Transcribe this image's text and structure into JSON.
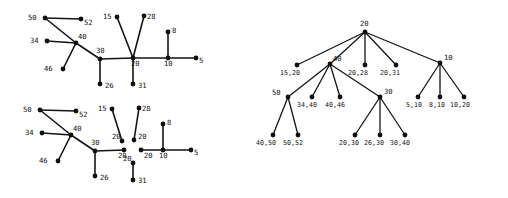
{
  "figure": {
    "panels": [
      {
        "id": "graph-top-left",
        "kind": "graph",
        "nodes": [
          {
            "label": "50",
            "x": 45,
            "y": 18,
            "lx": 28,
            "ly": 20
          },
          {
            "label": "52",
            "x": 81,
            "y": 19,
            "lx": 84,
            "ly": 25
          },
          {
            "label": "34",
            "x": 47,
            "y": 41,
            "lx": 30,
            "ly": 43
          },
          {
            "label": "40",
            "x": 76,
            "y": 43,
            "lx": 78,
            "ly": 39
          },
          {
            "label": "46",
            "x": 63,
            "y": 69,
            "lx": 44,
            "ly": 71
          },
          {
            "label": "30",
            "x": 100,
            "y": 59,
            "lx": 96,
            "ly": 53
          },
          {
            "label": "26",
            "x": 100,
            "y": 84,
            "lx": 105,
            "ly": 88
          },
          {
            "label": "15",
            "x": 117,
            "y": 17,
            "lx": 103,
            "ly": 19
          },
          {
            "label": "28",
            "x": 144,
            "y": 16,
            "lx": 147,
            "ly": 19
          },
          {
            "label": "20",
            "x": 133,
            "y": 58,
            "lx": 131,
            "ly": 66
          },
          {
            "label": "31",
            "x": 133,
            "y": 84,
            "lx": 138,
            "ly": 88
          },
          {
            "label": "8",
            "x": 168,
            "y": 32,
            "lx": 172,
            "ly": 33
          },
          {
            "label": "10",
            "x": 168,
            "y": 58,
            "lx": 164,
            "ly": 66
          },
          {
            "label": "5",
            "x": 196,
            "y": 58,
            "lx": 199,
            "ly": 63
          }
        ],
        "edges": [
          [
            0,
            1
          ],
          [
            0,
            3
          ],
          [
            2,
            3
          ],
          [
            3,
            4
          ],
          [
            3,
            5
          ],
          [
            5,
            6
          ],
          [
            5,
            9
          ],
          [
            7,
            9
          ],
          [
            8,
            9
          ],
          [
            9,
            10
          ],
          [
            9,
            12
          ],
          [
            11,
            12
          ],
          [
            12,
            13
          ]
        ],
        "edge_labels": []
      },
      {
        "id": "graph-bottom-left",
        "kind": "graph",
        "nodes": [
          {
            "label": "50",
            "x": 40,
            "y": 110,
            "lx": 23,
            "ly": 112
          },
          {
            "label": "52",
            "x": 76,
            "y": 111,
            "lx": 79,
            "ly": 117
          },
          {
            "label": "34",
            "x": 42,
            "y": 133,
            "lx": 25,
            "ly": 135
          },
          {
            "label": "40",
            "x": 71,
            "y": 135,
            "lx": 73,
            "ly": 131
          },
          {
            "label": "46",
            "x": 58,
            "y": 161,
            "lx": 39,
            "ly": 163
          },
          {
            "label": "30",
            "x": 95,
            "y": 151,
            "lx": 91,
            "ly": 145
          },
          {
            "label": "26",
            "x": 95,
            "y": 176,
            "lx": 100,
            "ly": 180
          },
          {
            "label": "15",
            "x": 112,
            "y": 109,
            "lx": 98,
            "ly": 111
          },
          {
            "label": "28",
            "x": 139,
            "y": 108,
            "lx": 142,
            "ly": 111
          },
          {
            "label": "20",
            "x": 124,
            "y": 150,
            "lx": 118,
            "ly": 158
          },
          {
            "label": "20",
            "x": 122,
            "y": 141,
            "lx": 112,
            "ly": 139
          },
          {
            "label": "20",
            "x": 134,
            "y": 140,
            "lx": 138,
            "ly": 139
          },
          {
            "label": "20",
            "x": 141,
            "y": 150,
            "lx": 144,
            "ly": 158
          },
          {
            "label": "20",
            "x": 133,
            "y": 163,
            "lx": 123,
            "ly": 161
          },
          {
            "label": "31",
            "x": 133,
            "y": 180,
            "lx": 138,
            "ly": 183
          },
          {
            "label": "8",
            "x": 163,
            "y": 124,
            "lx": 167,
            "ly": 125
          },
          {
            "label": "10",
            "x": 163,
            "y": 150,
            "lx": 159,
            "ly": 158
          },
          {
            "label": "5",
            "x": 191,
            "y": 150,
            "lx": 194,
            "ly": 155
          }
        ],
        "edges": [
          [
            0,
            1
          ],
          [
            0,
            3
          ],
          [
            2,
            3
          ],
          [
            3,
            4
          ],
          [
            3,
            5
          ],
          [
            5,
            6
          ],
          [
            5,
            9
          ],
          [
            7,
            10
          ],
          [
            8,
            11
          ],
          [
            12,
            16
          ],
          [
            13,
            14
          ],
          [
            15,
            16
          ],
          [
            16,
            17
          ]
        ],
        "edge_labels": []
      },
      {
        "id": "tree-right",
        "kind": "tree",
        "nodes": [
          {
            "label": "20",
            "x": 365,
            "y": 32,
            "lx": 360,
            "ly": 26
          },
          {
            "label": "15,20",
            "x": 297,
            "y": 65,
            "lx": 280,
            "ly": 75
          },
          {
            "label": "40",
            "x": 330,
            "y": 64,
            "lx": 333,
            "ly": 61
          },
          {
            "label": "20,28",
            "x": 365,
            "y": 65,
            "lx": 348,
            "ly": 75
          },
          {
            "label": "20,31",
            "x": 396,
            "y": 65,
            "lx": 380,
            "ly": 75
          },
          {
            "label": "10",
            "x": 440,
            "y": 63,
            "lx": 444,
            "ly": 60
          },
          {
            "label": "50",
            "x": 288,
            "y": 97,
            "lx": 272,
            "ly": 95
          },
          {
            "label": "34,40",
            "x": 312,
            "y": 97,
            "lx": 297,
            "ly": 107
          },
          {
            "label": "40,46",
            "x": 340,
            "y": 97,
            "lx": 325,
            "ly": 107
          },
          {
            "label": "30",
            "x": 380,
            "y": 97,
            "lx": 384,
            "ly": 94
          },
          {
            "label": "5,10",
            "x": 418,
            "y": 97,
            "lx": 406,
            "ly": 107
          },
          {
            "label": "8,10",
            "x": 440,
            "y": 97,
            "lx": 429,
            "ly": 107
          },
          {
            "label": "10,20",
            "x": 464,
            "y": 97,
            "lx": 450,
            "ly": 107
          },
          {
            "label": "40,50",
            "x": 273,
            "y": 135,
            "lx": 256,
            "ly": 145
          },
          {
            "label": "50,52",
            "x": 298,
            "y": 135,
            "lx": 283,
            "ly": 145
          },
          {
            "label": "20,30",
            "x": 355,
            "y": 135,
            "lx": 339,
            "ly": 145
          },
          {
            "label": "26,30",
            "x": 380,
            "y": 135,
            "lx": 364,
            "ly": 145
          },
          {
            "label": "30,40",
            "x": 405,
            "y": 135,
            "lx": 390,
            "ly": 145
          }
        ],
        "edges": [
          [
            0,
            1
          ],
          [
            0,
            2
          ],
          [
            0,
            3
          ],
          [
            0,
            4
          ],
          [
            0,
            5
          ],
          [
            2,
            6
          ],
          [
            2,
            7
          ],
          [
            2,
            8
          ],
          [
            2,
            9
          ],
          [
            5,
            10
          ],
          [
            5,
            11
          ],
          [
            5,
            12
          ],
          [
            6,
            13
          ],
          [
            6,
            14
          ],
          [
            9,
            15
          ],
          [
            9,
            16
          ],
          [
            9,
            17
          ]
        ],
        "edge_labels": []
      }
    ]
  }
}
